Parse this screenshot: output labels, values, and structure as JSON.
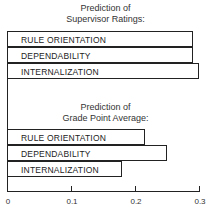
{
  "chart_data": [
    {
      "type": "bar",
      "orientation": "horizontal",
      "title": "Prediction of Supervisor Ratings:",
      "title_lines": [
        "Prediction of",
        "Supervisor Ratings:"
      ],
      "categories": [
        "RULE ORIENTATION",
        "DEPENDABILITY",
        "INTERNALIZATION"
      ],
      "values": [
        0.29,
        0.29,
        0.3
      ],
      "xlim": [
        0,
        0.3
      ],
      "xticks": [
        "0",
        "0.1",
        "0.2",
        "0.3"
      ],
      "grid": false,
      "legend": "none"
    },
    {
      "type": "bar",
      "orientation": "horizontal",
      "title": "Prediction of Grade Point Average:",
      "title_lines": [
        "Prediction of",
        "Grade Point Average:"
      ],
      "categories": [
        "RULE ORIENTATION",
        "DEPENDABILITY",
        "INTERNALIZATION"
      ],
      "values": [
        0.215,
        0.25,
        0.18
      ],
      "xlim": [
        0,
        0.3
      ],
      "xticks": [
        "0",
        "0.1",
        "0.2",
        "0.3"
      ],
      "grid": false,
      "legend": "none"
    }
  ],
  "panel1": {
    "title1": "Prediction of",
    "title2": "Supervisor Ratings:",
    "bars": [
      {
        "label": "RULE ORIENTATION",
        "value": 0.29
      },
      {
        "label": "DEPENDABILITY",
        "value": 0.29
      },
      {
        "label": "INTERNALIZATION",
        "value": 0.3
      }
    ]
  },
  "panel2": {
    "title1": "Prediction of",
    "title2": "Grade Point Average:",
    "bars": [
      {
        "label": "RULE ORIENTATION",
        "value": 0.215
      },
      {
        "label": "DEPENDABILITY",
        "value": 0.25
      },
      {
        "label": "INTERNALIZATION",
        "value": 0.18
      }
    ]
  },
  "axis": {
    "ticks": [
      {
        "label": "0",
        "value": 0
      },
      {
        "label": "0.1",
        "value": 0.1
      },
      {
        "label": "0.2",
        "value": 0.2
      },
      {
        "label": "0.3",
        "value": 0.3
      }
    ]
  }
}
